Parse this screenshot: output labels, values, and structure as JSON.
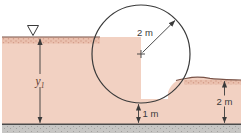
{
  "labels": {
    "left_depth": {
      "base": "y",
      "sub": "1"
    },
    "cylinder_radius": "2 m",
    "bottom_gap": "1 m",
    "right_depth": "2 m"
  },
  "icons": {
    "water_surface_icon": "∇"
  },
  "colors": {
    "water": "#f2d1c2",
    "water_stipple_base": "#eac0ae",
    "water_stipple_dot": "#d39a86",
    "outline": "#3a3a3a",
    "surface_line": "#7a5347",
    "ground_base": "#c7c6c4",
    "ground_dot": "#a3a2a0",
    "ground_top_line": "#4a4a4a",
    "y1_label": "#5d392f"
  }
}
